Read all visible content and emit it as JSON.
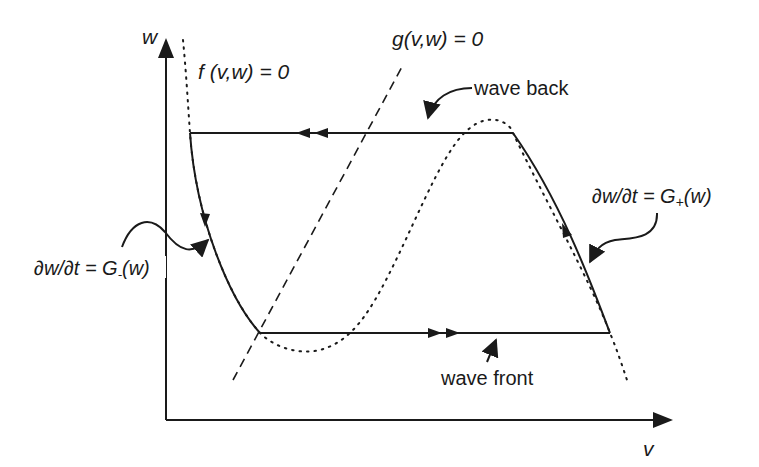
{
  "diagram": {
    "type": "phase-plane",
    "axes": {
      "x_label": "v",
      "y_label": "w"
    },
    "nullclines": {
      "f": {
        "label": "f (v,w) = 0",
        "style": "dotted",
        "shape": "cubic"
      },
      "g": {
        "label": "g(v,w) = 0",
        "style": "dashed",
        "shape": "line"
      }
    },
    "trajectory": {
      "wave_back_label": "wave back",
      "wave_front_label": "wave front",
      "left_branch_label": "∂w/∂t = G₋(w)",
      "right_branch_label": "∂w/∂t = G₊(w)"
    },
    "colors": {
      "ink": "#1a1a1a",
      "background": "#ffffff"
    }
  },
  "labels": {
    "w_axis": "w",
    "v_axis": "v",
    "f_nullcline": "f (v,w) = 0",
    "g_nullcline": "g(v,w) = 0",
    "wave_back": "wave back",
    "wave_front": "wave front",
    "g_minus_prefix": "∂w/∂t = G",
    "g_minus_sub": "-",
    "g_minus_suffix": "(w)",
    "g_plus_prefix": "∂w/∂t = G",
    "g_plus_sub": "+",
    "g_plus_suffix": "(w)"
  }
}
